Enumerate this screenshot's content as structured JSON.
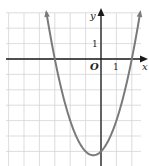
{
  "chart_data": {
    "type": "line",
    "title": "",
    "xlabel": "x",
    "ylabel": "y",
    "origin_label": "O",
    "x_tick_label": "1",
    "y_tick_label": "1",
    "function": "y = x^2 + x - 6",
    "series": [
      {
        "name": "parabola",
        "x": [
          -3.54,
          -3,
          -2.5,
          -2,
          -1.5,
          -1,
          -0.5,
          0,
          0.5,
          1,
          1.5,
          2,
          2.54
        ],
        "values": [
          3.0,
          0,
          -2.25,
          -4,
          -5.25,
          -6,
          -6.25,
          -6,
          -5.25,
          -4,
          -2.25,
          0,
          3.0
        ]
      }
    ],
    "x_intercepts": [
      -3,
      2
    ],
    "y_intercept": -6,
    "vertex": [
      -0.5,
      -6.25
    ],
    "xlim": [
      -6.2,
      3.0
    ],
    "ylim": [
      -6.9,
      3.2
    ],
    "grid": true,
    "grid_step": 1,
    "legend": null,
    "colors": {
      "curve": "#7a7a7a",
      "axis": "#1a1a1a",
      "grid": "#d4d4d4"
    }
  }
}
